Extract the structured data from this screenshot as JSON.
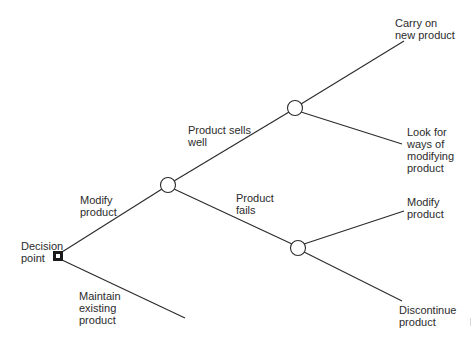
{
  "diagram": {
    "type": "decision-tree",
    "line_color": "#2a2a2a",
    "nodes": {
      "decision_point": {
        "label": "Decision\npoint",
        "shape": "square"
      },
      "chance_modify": {
        "shape": "circle"
      },
      "chance_sells": {
        "shape": "circle"
      },
      "chance_fails": {
        "shape": "circle"
      }
    },
    "branches": {
      "modify_product": "Modify\nproduct",
      "maintain_existing": "Maintain\nexisting\nproduct",
      "sells_well": "Product sells\nwell",
      "fails": "Product\nfails"
    },
    "outcomes": {
      "carry_on": "Carry on\nnew product",
      "look_for_ways": "Look for\nways of\nmodifying\nproduct",
      "modify_product": "Modify\nproduct",
      "discontinue": "Discontinue\nproduct"
    }
  }
}
